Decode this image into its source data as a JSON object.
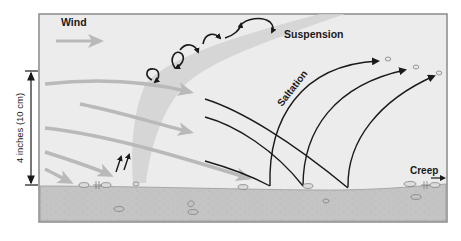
{
  "labels": {
    "wind": "Wind",
    "suspension": "Suspension",
    "saltation": "Saltation",
    "creep": "Creep",
    "height_scale": "4 inches (10 cm)"
  },
  "colors": {
    "air": "#ececec",
    "ground": "#c4c4c4",
    "wind_arrow": "#b9b9b9",
    "dust_plume": "#d2d2d2",
    "trajectory": "#1a1a1a",
    "frame": "#8a8a8a"
  },
  "processes": [
    {
      "name": "Suspension",
      "description": "fine particles carried upward in swirling air"
    },
    {
      "name": "Saltation",
      "description": "grains bounce in arcing trajectories"
    },
    {
      "name": "Creep",
      "description": "larger grains rolled along the surface"
    }
  ]
}
